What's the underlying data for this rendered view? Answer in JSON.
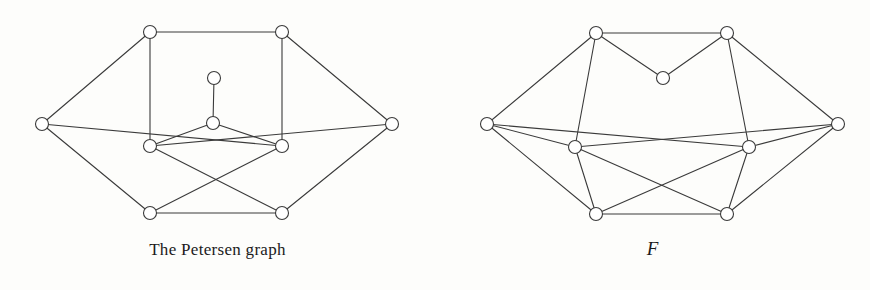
{
  "figure": {
    "background_color": "#fdfdfb",
    "ink_color": "#3a3a3a",
    "vertex_fill": "#ffffff",
    "vertex_radius": 6.5,
    "edge_width": 1.1
  },
  "panels": [
    {
      "id": "petersen",
      "caption": "The Petersen graph",
      "caption_style": "roman",
      "vertex_count": 10,
      "edge_count": 15,
      "vertices": [
        {
          "name": "outer-left",
          "x": 42,
          "y": 124
        },
        {
          "name": "outer-top-left",
          "x": 150,
          "y": 32
        },
        {
          "name": "outer-top-right",
          "x": 282,
          "y": 32
        },
        {
          "name": "outer-right",
          "x": 392,
          "y": 124
        },
        {
          "name": "outer-bottom-right",
          "x": 282,
          "y": 213
        },
        {
          "name": "outer-bottom-left",
          "x": 150,
          "y": 213
        },
        {
          "name": "inner-top",
          "x": 214,
          "y": 78
        },
        {
          "name": "inner-center",
          "x": 213,
          "y": 123
        },
        {
          "name": "inner-left",
          "x": 150,
          "y": 146
        },
        {
          "name": "inner-right",
          "x": 282,
          "y": 146
        }
      ],
      "edges": [
        [
          "outer-left",
          "outer-top-left"
        ],
        [
          "outer-top-left",
          "outer-top-right"
        ],
        [
          "outer-top-right",
          "outer-right"
        ],
        [
          "outer-right",
          "outer-bottom-right"
        ],
        [
          "outer-bottom-right",
          "outer-bottom-left"
        ],
        [
          "outer-bottom-left",
          "outer-left"
        ],
        [
          "outer-left",
          "inner-right"
        ],
        [
          "outer-right",
          "inner-left"
        ],
        [
          "outer-top-left",
          "inner-left"
        ],
        [
          "outer-top-right",
          "inner-right"
        ],
        [
          "inner-top",
          "inner-center"
        ],
        [
          "inner-center",
          "inner-left"
        ],
        [
          "inner-center",
          "inner-right"
        ],
        [
          "inner-left",
          "outer-bottom-right"
        ],
        [
          "inner-right",
          "outer-bottom-left"
        ]
      ]
    },
    {
      "id": "graph-F",
      "caption": "F",
      "caption_style": "italic",
      "vertex_count": 10,
      "edge_count": 21,
      "vertices": [
        {
          "name": "outer-left",
          "x": 487,
          "y": 124
        },
        {
          "name": "outer-top-left",
          "x": 596,
          "y": 33
        },
        {
          "name": "outer-top-right",
          "x": 727,
          "y": 33
        },
        {
          "name": "outer-right",
          "x": 838,
          "y": 124
        },
        {
          "name": "outer-bottom-right",
          "x": 727,
          "y": 214
        },
        {
          "name": "outer-bottom-left",
          "x": 596,
          "y": 214
        },
        {
          "name": "inner-top",
          "x": 663,
          "y": 78
        },
        {
          "name": "inner-left",
          "x": 575,
          "y": 147
        },
        {
          "name": "inner-right",
          "x": 749,
          "y": 147
        }
      ],
      "edges": [
        [
          "outer-left",
          "outer-top-left"
        ],
        [
          "outer-top-left",
          "outer-top-right"
        ],
        [
          "outer-top-right",
          "outer-right"
        ],
        [
          "outer-right",
          "outer-bottom-right"
        ],
        [
          "outer-bottom-right",
          "outer-bottom-left"
        ],
        [
          "outer-bottom-left",
          "outer-left"
        ],
        [
          "outer-left",
          "inner-left"
        ],
        [
          "outer-left",
          "inner-right"
        ],
        [
          "outer-right",
          "inner-right"
        ],
        [
          "outer-right",
          "inner-left"
        ],
        [
          "outer-top-left",
          "inner-top"
        ],
        [
          "outer-top-right",
          "inner-top"
        ],
        [
          "outer-top-left",
          "inner-left"
        ],
        [
          "outer-top-right",
          "inner-right"
        ],
        [
          "inner-left",
          "outer-bottom-left"
        ],
        [
          "inner-right",
          "outer-bottom-right"
        ],
        [
          "inner-left",
          "outer-bottom-right"
        ],
        [
          "inner-right",
          "outer-bottom-left"
        ]
      ]
    }
  ]
}
